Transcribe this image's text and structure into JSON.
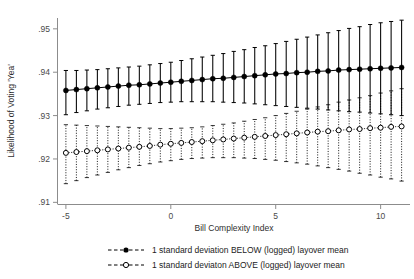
{
  "chart_data": {
    "type": "line",
    "title": "",
    "subtitle": "",
    "xlabel": "Bill Complexity Index",
    "ylabel": "Likelihood of Voting 'Yea'",
    "xlim": [
      -5.4,
      11.4
    ],
    "ylim": [
      0.9095,
      0.9525
    ],
    "xticks": [
      -5,
      0,
      5,
      10
    ],
    "xticklabels": [
      "-5",
      "0",
      "5",
      "10"
    ],
    "yticks": [
      0.91,
      0.92,
      0.93,
      0.94,
      0.95
    ],
    "yticklabels": [
      ".91",
      ".92",
      ".93",
      ".94",
      ".95"
    ],
    "grid": false,
    "legend_position": "below-axes",
    "error_bars": "vertical 95% confidence intervals with caps",
    "x": [
      -5,
      -4.5,
      -4,
      -3.5,
      -3,
      -2.5,
      -2,
      -1.5,
      -1,
      -0.5,
      0,
      0.5,
      1,
      1.5,
      2,
      2.5,
      3,
      3.5,
      4,
      4.5,
      5,
      5.5,
      6,
      6.5,
      7,
      7.5,
      8,
      8.5,
      9,
      9.5,
      10,
      10.5,
      11
    ],
    "series": [
      {
        "name": "1 standard deviation BELOW (logged) layover mean",
        "marker": "filled-circle",
        "linestyle": "solid",
        "color": "#000000",
        "values": [
          0.9358,
          0.936,
          0.9362,
          0.9364,
          0.9366,
          0.9368,
          0.937,
          0.9371,
          0.9373,
          0.9375,
          0.9377,
          0.9379,
          0.9381,
          0.9383,
          0.9385,
          0.9386,
          0.9388,
          0.939,
          0.9392,
          0.9394,
          0.9396,
          0.9397,
          0.9399,
          0.94,
          0.9402,
          0.9403,
          0.9405,
          0.9406,
          0.9407,
          0.9408,
          0.9409,
          0.941,
          0.9411
        ],
        "ci_lower": [
          0.9302,
          0.9307,
          0.9311,
          0.9315,
          0.9318,
          0.9321,
          0.9324,
          0.9326,
          0.9328,
          0.933,
          0.9331,
          0.9332,
          0.9332,
          0.9332,
          0.9332,
          0.9331,
          0.933,
          0.9329,
          0.9327,
          0.9325,
          0.9323,
          0.9321,
          0.9319,
          0.9317,
          0.9315,
          0.9313,
          0.9311,
          0.9309,
          0.9308,
          0.9306,
          0.9304,
          0.9302,
          0.93
        ],
        "ci_upper": [
          0.9404,
          0.9404,
          0.9405,
          0.9406,
          0.9408,
          0.941,
          0.9412,
          0.9414,
          0.9417,
          0.942,
          0.9423,
          0.9427,
          0.9431,
          0.9435,
          0.9439,
          0.9443,
          0.9448,
          0.9452,
          0.9457,
          0.9461,
          0.9466,
          0.9471,
          0.9476,
          0.9481,
          0.9486,
          0.9491,
          0.9496,
          0.9501,
          0.9505,
          0.951,
          0.9514,
          0.9517,
          0.952
        ]
      },
      {
        "name": "1 standard deviaton ABOVE (logged) layover mean",
        "marker": "open-circle",
        "linestyle": "dotted",
        "color": "#000000",
        "values": [
          0.9214,
          0.9216,
          0.9218,
          0.922,
          0.9222,
          0.9224,
          0.9226,
          0.9228,
          0.923,
          0.9233,
          0.9235,
          0.9237,
          0.9239,
          0.9241,
          0.9243,
          0.9245,
          0.9247,
          0.9249,
          0.9251,
          0.9253,
          0.9255,
          0.9257,
          0.9259,
          0.9261,
          0.9263,
          0.9264,
          0.9266,
          0.9268,
          0.9269,
          0.9271,
          0.9272,
          0.9274,
          0.9275
        ],
        "ci_lower": [
          0.9143,
          0.915,
          0.9157,
          0.9163,
          0.9169,
          0.9175,
          0.918,
          0.9185,
          0.9189,
          0.9193,
          0.9196,
          0.9199,
          0.9201,
          0.9202,
          0.9203,
          0.9203,
          0.9203,
          0.9202,
          0.9201,
          0.9199,
          0.9197,
          0.9194,
          0.9191,
          0.9188,
          0.9184,
          0.918,
          0.9176,
          0.9172,
          0.9167,
          0.9163,
          0.9158,
          0.9154,
          0.9149
        ],
        "ci_upper": [
          0.9279,
          0.9278,
          0.9277,
          0.9276,
          0.9275,
          0.9274,
          0.9273,
          0.9272,
          0.9271,
          0.927,
          0.927,
          0.9271,
          0.9272,
          0.9274,
          0.9277,
          0.928,
          0.9283,
          0.9287,
          0.9291,
          0.9295,
          0.93,
          0.9305,
          0.931,
          0.9315,
          0.932,
          0.9325,
          0.9331,
          0.9336,
          0.9341,
          0.9346,
          0.9352,
          0.9357,
          0.9362
        ]
      }
    ],
    "legend": [
      {
        "label": "1 standard deviation BELOW (logged) layover mean",
        "marker": "filled-circle",
        "linestyle": "dashed"
      },
      {
        "label": "1 standard deviaton ABOVE (logged) layover mean",
        "marker": "open-circle",
        "linestyle": "dashed"
      }
    ]
  }
}
